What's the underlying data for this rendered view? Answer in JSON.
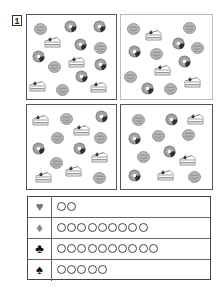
{
  "question_number": "1",
  "panels": [
    {
      "id": "panel-1",
      "style": "dark",
      "selected": true,
      "items": [
        {
          "type": "cookie",
          "x": 40,
          "y": 27
        },
        {
          "type": "donut",
          "x": 70,
          "y": 25
        },
        {
          "type": "donut",
          "x": 99,
          "y": 25
        },
        {
          "type": "cake",
          "x": 52,
          "y": 40
        },
        {
          "type": "donut",
          "x": 80,
          "y": 43
        },
        {
          "type": "cookie",
          "x": 100,
          "y": 46
        },
        {
          "type": "donut",
          "x": 38,
          "y": 55
        },
        {
          "type": "cookie",
          "x": 54,
          "y": 65
        },
        {
          "type": "cake",
          "x": 76,
          "y": 60
        },
        {
          "type": "donut",
          "x": 100,
          "y": 63
        },
        {
          "type": "donut",
          "x": 81,
          "y": 75
        },
        {
          "type": "cake",
          "x": 37,
          "y": 84
        },
        {
          "type": "cookie",
          "x": 62,
          "y": 88
        },
        {
          "type": "cake",
          "x": 98,
          "y": 85
        }
      ]
    },
    {
      "id": "panel-2",
      "style": "light",
      "selected": false,
      "items": [
        {
          "type": "cookie",
          "x": 133,
          "y": 27
        },
        {
          "type": "cake",
          "x": 153,
          "y": 33
        },
        {
          "type": "cookie",
          "x": 189,
          "y": 26
        },
        {
          "type": "donut",
          "x": 178,
          "y": 42
        },
        {
          "type": "cookie",
          "x": 197,
          "y": 46
        },
        {
          "type": "donut",
          "x": 134,
          "y": 50
        },
        {
          "type": "cookie",
          "x": 156,
          "y": 52
        },
        {
          "type": "donut",
          "x": 184,
          "y": 60
        },
        {
          "type": "cake",
          "x": 162,
          "y": 68
        },
        {
          "type": "cookie",
          "x": 130,
          "y": 75
        },
        {
          "type": "donut",
          "x": 147,
          "y": 87
        },
        {
          "type": "cookie",
          "x": 170,
          "y": 87
        },
        {
          "type": "cake",
          "x": 192,
          "y": 80
        }
      ]
    },
    {
      "id": "panel-3",
      "style": "dark",
      "selected": false,
      "items": [
        {
          "type": "cake",
          "x": 40,
          "y": 118
        },
        {
          "type": "cookie",
          "x": 66,
          "y": 117
        },
        {
          "type": "donut",
          "x": 101,
          "y": 115
        },
        {
          "type": "cake",
          "x": 81,
          "y": 128
        },
        {
          "type": "cookie",
          "x": 57,
          "y": 136
        },
        {
          "type": "cookie",
          "x": 100,
          "y": 136
        },
        {
          "type": "donut",
          "x": 38,
          "y": 147
        },
        {
          "type": "donut",
          "x": 79,
          "y": 147
        },
        {
          "type": "cake",
          "x": 99,
          "y": 155
        },
        {
          "type": "cookie",
          "x": 56,
          "y": 161
        },
        {
          "type": "cake",
          "x": 73,
          "y": 169
        },
        {
          "type": "cake",
          "x": 43,
          "y": 175
        },
        {
          "type": "cookie",
          "x": 99,
          "y": 176
        }
      ]
    },
    {
      "id": "panel-4",
      "style": "dark",
      "selected": false,
      "items": [
        {
          "type": "cookie",
          "x": 138,
          "y": 118
        },
        {
          "type": "donut",
          "x": 171,
          "y": 118
        },
        {
          "type": "cake",
          "x": 195,
          "y": 117
        },
        {
          "type": "donut",
          "x": 134,
          "y": 137
        },
        {
          "type": "cookie",
          "x": 158,
          "y": 134
        },
        {
          "type": "cookie",
          "x": 188,
          "y": 133
        },
        {
          "type": "cookie",
          "x": 143,
          "y": 155
        },
        {
          "type": "donut",
          "x": 169,
          "y": 150
        },
        {
          "type": "cake",
          "x": 187,
          "y": 158
        },
        {
          "type": "donut",
          "x": 134,
          "y": 174
        },
        {
          "type": "cake",
          "x": 165,
          "y": 173
        },
        {
          "type": "cookie",
          "x": 194,
          "y": 175
        }
      ]
    }
  ],
  "tally": [
    {
      "suit": "heart",
      "glyph": "♥",
      "color": "#777777",
      "count": 2
    },
    {
      "suit": "diamond",
      "glyph": "♦",
      "color": "#888888",
      "count": 9
    },
    {
      "suit": "club",
      "glyph": "♣",
      "color": "#111111",
      "count": 10
    },
    {
      "suit": "spade",
      "glyph": "♠",
      "color": "#111111",
      "count": 5
    }
  ]
}
